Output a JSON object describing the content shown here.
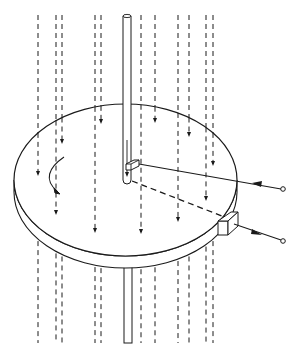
{
  "diagram": {
    "colors": {
      "stroke": "#1a1a1a",
      "background": "#ffffff",
      "face": "#ffffff"
    },
    "disc": {
      "cx": 125.5,
      "cy": 180,
      "rx": 111.5,
      "ry": 76,
      "thickness": 12
    },
    "rod": {
      "x": 123,
      "width": 8,
      "top": 15,
      "bottom_upper": 183,
      "lower_top": 268,
      "lower_bottom": 343
    },
    "flow_lines": [
      {
        "x": 38,
        "arrow_y": 174
      },
      {
        "x": 56,
        "arrow_y": 213
      },
      {
        "x": 62,
        "arrow_y": 142
      },
      {
        "x": 95,
        "arrow_y": 231
      },
      {
        "x": 101,
        "arrow_y": 122
      },
      {
        "x": 141,
        "arrow_y": 232
      },
      {
        "x": 155,
        "arrow_y": 121
      },
      {
        "x": 178,
        "arrow_y": 220
      },
      {
        "x": 189,
        "arrow_y": 135
      },
      {
        "x": 206,
        "arrow_y": 199
      },
      {
        "x": 213,
        "arrow_y": 164
      }
    ],
    "terminals": [
      {
        "name": "input-terminal",
        "x": 283,
        "y": 189
      },
      {
        "name": "output-terminal",
        "x": 283,
        "y": 241
      }
    ]
  }
}
